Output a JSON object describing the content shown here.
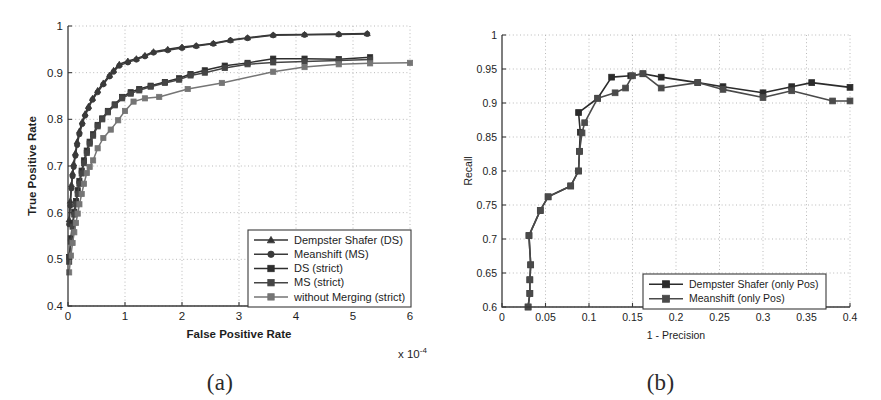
{
  "figure": {
    "background_color": "#ffffff",
    "captions": [
      {
        "key": "a",
        "text": "(a)"
      },
      {
        "key": "b",
        "text": "(b)"
      }
    ]
  },
  "chart_data": [
    {
      "id": "panel-a",
      "type": "line",
      "title": "",
      "xlabel": "False Positive Rate",
      "ylabel": "True Positive Rate",
      "x_exponent_label": "x 10",
      "x_exponent_power": "-4",
      "xlim": [
        0,
        6
      ],
      "ylim": [
        0.4,
        1
      ],
      "xticks": [
        "0",
        "1",
        "2",
        "3",
        "4",
        "5",
        "6"
      ],
      "xtick_values": [
        0,
        1,
        2,
        3,
        4,
        5,
        6
      ],
      "yticks": [
        "0.4",
        "0.5",
        "0.6",
        "0.7",
        "0.8",
        "0.9",
        "1"
      ],
      "ytick_values": [
        0.4,
        0.5,
        0.6,
        0.7,
        0.8,
        0.9,
        1
      ],
      "grid": true,
      "legend_position": "lower right",
      "series": [
        {
          "name": "Dempster Shafer (DS)",
          "marker": "triangle",
          "color": "#333333",
          "points": [
            [
              0.02,
              0.585
            ],
            [
              0.04,
              0.625
            ],
            [
              0.06,
              0.66
            ],
            [
              0.08,
              0.685
            ],
            [
              0.1,
              0.705
            ],
            [
              0.13,
              0.728
            ],
            [
              0.16,
              0.752
            ],
            [
              0.2,
              0.775
            ],
            [
              0.25,
              0.795
            ],
            [
              0.3,
              0.812
            ],
            [
              0.36,
              0.828
            ],
            [
              0.43,
              0.845
            ],
            [
              0.52,
              0.862
            ],
            [
              0.62,
              0.878
            ],
            [
              0.73,
              0.895
            ],
            [
              0.8,
              0.905
            ],
            [
              0.9,
              0.918
            ],
            [
              1.05,
              0.925
            ],
            [
              1.2,
              0.93
            ],
            [
              1.35,
              0.937
            ],
            [
              1.5,
              0.945
            ],
            [
              1.75,
              0.95
            ],
            [
              2.0,
              0.955
            ],
            [
              2.25,
              0.958
            ],
            [
              2.55,
              0.963
            ],
            [
              2.85,
              0.97
            ],
            [
              3.15,
              0.975
            ],
            [
              3.6,
              0.981
            ],
            [
              4.15,
              0.982
            ],
            [
              4.75,
              0.983
            ],
            [
              5.25,
              0.984
            ]
          ]
        },
        {
          "name": "Meanshift (MS)",
          "marker": "circle",
          "color": "#3a3a3a",
          "points": [
            [
              0.02,
              0.575
            ],
            [
              0.04,
              0.615
            ],
            [
              0.06,
              0.652
            ],
            [
              0.08,
              0.678
            ],
            [
              0.1,
              0.698
            ],
            [
              0.13,
              0.722
            ],
            [
              0.16,
              0.745
            ],
            [
              0.2,
              0.768
            ],
            [
              0.25,
              0.79
            ],
            [
              0.3,
              0.808
            ],
            [
              0.36,
              0.824
            ],
            [
              0.43,
              0.842
            ],
            [
              0.52,
              0.858
            ],
            [
              0.62,
              0.875
            ],
            [
              0.73,
              0.892
            ],
            [
              0.8,
              0.902
            ],
            [
              0.9,
              0.915
            ],
            [
              1.05,
              0.922
            ],
            [
              1.2,
              0.928
            ],
            [
              1.35,
              0.935
            ],
            [
              1.5,
              0.943
            ],
            [
              1.75,
              0.948
            ],
            [
              2.0,
              0.953
            ],
            [
              2.25,
              0.957
            ],
            [
              2.55,
              0.962
            ],
            [
              2.85,
              0.969
            ],
            [
              3.15,
              0.974
            ],
            [
              3.6,
              0.98
            ],
            [
              4.15,
              0.981
            ],
            [
              4.75,
              0.982
            ],
            [
              5.25,
              0.983
            ]
          ]
        },
        {
          "name": "DS (strict)",
          "marker": "square",
          "color": "#2e2e2e",
          "points": [
            [
              0.02,
              0.505
            ],
            [
              0.05,
              0.545
            ],
            [
              0.08,
              0.578
            ],
            [
              0.11,
              0.602
            ],
            [
              0.14,
              0.625
            ],
            [
              0.17,
              0.648
            ],
            [
              0.2,
              0.668
            ],
            [
              0.24,
              0.69
            ],
            [
              0.28,
              0.712
            ],
            [
              0.33,
              0.733
            ],
            [
              0.38,
              0.752
            ],
            [
              0.44,
              0.768
            ],
            [
              0.52,
              0.788
            ],
            [
              0.6,
              0.802
            ],
            [
              0.7,
              0.818
            ],
            [
              0.82,
              0.832
            ],
            [
              0.95,
              0.848
            ],
            [
              1.1,
              0.858
            ],
            [
              1.25,
              0.865
            ],
            [
              1.45,
              0.872
            ],
            [
              1.7,
              0.88
            ],
            [
              1.95,
              0.888
            ],
            [
              2.15,
              0.897
            ],
            [
              2.4,
              0.905
            ],
            [
              2.75,
              0.915
            ],
            [
              3.15,
              0.921
            ],
            [
              3.6,
              0.93
            ],
            [
              4.15,
              0.93
            ],
            [
              4.75,
              0.929
            ],
            [
              5.3,
              0.933
            ]
          ]
        },
        {
          "name": "MS (strict)",
          "marker": "square",
          "color": "#454545",
          "points": [
            [
              0.02,
              0.495
            ],
            [
              0.05,
              0.538
            ],
            [
              0.08,
              0.57
            ],
            [
              0.11,
              0.596
            ],
            [
              0.14,
              0.618
            ],
            [
              0.17,
              0.64
            ],
            [
              0.2,
              0.662
            ],
            [
              0.24,
              0.684
            ],
            [
              0.28,
              0.706
            ],
            [
              0.33,
              0.728
            ],
            [
              0.38,
              0.748
            ],
            [
              0.44,
              0.765
            ],
            [
              0.52,
              0.785
            ],
            [
              0.6,
              0.8
            ],
            [
              0.7,
              0.815
            ],
            [
              0.82,
              0.83
            ],
            [
              0.95,
              0.845
            ],
            [
              1.1,
              0.855
            ],
            [
              1.25,
              0.862
            ],
            [
              1.45,
              0.87
            ],
            [
              1.7,
              0.878
            ],
            [
              1.95,
              0.885
            ],
            [
              2.15,
              0.894
            ],
            [
              2.4,
              0.9
            ],
            [
              2.75,
              0.91
            ],
            [
              3.15,
              0.918
            ],
            [
              3.6,
              0.922
            ],
            [
              4.15,
              0.924
            ],
            [
              4.75,
              0.926
            ],
            [
              5.3,
              0.928
            ]
          ]
        },
        {
          "name": "without Merging (strict)",
          "marker": "square",
          "color": "#757575",
          "points": [
            [
              0.02,
              0.472
            ],
            [
              0.05,
              0.508
            ],
            [
              0.08,
              0.535
            ],
            [
              0.11,
              0.558
            ],
            [
              0.14,
              0.578
            ],
            [
              0.17,
              0.598
            ],
            [
              0.2,
              0.618
            ],
            [
              0.24,
              0.64
            ],
            [
              0.28,
              0.662
            ],
            [
              0.33,
              0.685
            ],
            [
              0.38,
              0.698
            ],
            [
              0.44,
              0.712
            ],
            [
              0.52,
              0.738
            ],
            [
              0.62,
              0.76
            ],
            [
              0.75,
              0.778
            ],
            [
              0.88,
              0.798
            ],
            [
              1.0,
              0.818
            ],
            [
              1.15,
              0.838
            ],
            [
              1.35,
              0.845
            ],
            [
              1.6,
              0.848
            ],
            [
              2.1,
              0.865
            ],
            [
              2.7,
              0.878
            ],
            [
              3.6,
              0.902
            ],
            [
              4.15,
              0.912
            ],
            [
              4.75,
              0.918
            ],
            [
              5.3,
              0.92
            ],
            [
              6.0,
              0.921
            ]
          ]
        }
      ]
    },
    {
      "id": "panel-b",
      "type": "line",
      "title": "",
      "xlabel": "1 - Precision",
      "ylabel": "Recall",
      "xlim": [
        0,
        0.4
      ],
      "ylim": [
        0.6,
        1
      ],
      "xticks": [
        "0",
        "0.05",
        "0.1",
        "0.15",
        "0.2",
        "0.25",
        "0.3",
        "0.35",
        "0.4"
      ],
      "xtick_values": [
        0,
        0.05,
        0.1,
        0.15,
        0.2,
        0.25,
        0.3,
        0.35,
        0.4
      ],
      "yticks": [
        "0.6",
        "0.65",
        "0.7",
        "0.75",
        "0.8",
        "0.85",
        "0.9",
        "0.95",
        "1"
      ],
      "ytick_values": [
        0.6,
        0.65,
        0.7,
        0.75,
        0.8,
        0.85,
        0.9,
        0.95,
        1
      ],
      "grid": true,
      "legend_position": "lower right",
      "series": [
        {
          "name": "Dempster Shafer (only Pos)",
          "marker": "square",
          "color": "#2b2b2b",
          "points": [
            [
              0.03,
              0.6
            ],
            [
              0.032,
              0.62
            ],
            [
              0.032,
              0.64
            ],
            [
              0.033,
              0.662
            ],
            [
              0.031,
              0.705
            ],
            [
              0.044,
              0.742
            ],
            [
              0.053,
              0.762
            ],
            [
              0.079,
              0.778
            ],
            [
              0.088,
              0.8
            ],
            [
              0.089,
              0.829
            ],
            [
              0.09,
              0.857
            ],
            [
              0.088,
              0.886
            ],
            [
              0.11,
              0.907
            ],
            [
              0.126,
              0.938
            ],
            [
              0.148,
              0.94
            ],
            [
              0.162,
              0.943
            ],
            [
              0.183,
              0.938
            ],
            [
              0.225,
              0.93
            ],
            [
              0.254,
              0.924
            ],
            [
              0.3,
              0.915
            ],
            [
              0.333,
              0.924
            ],
            [
              0.356,
              0.93
            ],
            [
              0.4,
              0.923
            ]
          ]
        },
        {
          "name": "Meanshift (only Pos)",
          "marker": "square",
          "color": "#4a4a4a",
          "points": [
            [
              0.03,
              0.6
            ],
            [
              0.032,
              0.62
            ],
            [
              0.032,
              0.64
            ],
            [
              0.033,
              0.662
            ],
            [
              0.031,
              0.705
            ],
            [
              0.044,
              0.742
            ],
            [
              0.053,
              0.762
            ],
            [
              0.079,
              0.778
            ],
            [
              0.088,
              0.8
            ],
            [
              0.089,
              0.829
            ],
            [
              0.092,
              0.856
            ],
            [
              0.095,
              0.871
            ],
            [
              0.11,
              0.907
            ],
            [
              0.13,
              0.915
            ],
            [
              0.142,
              0.922
            ],
            [
              0.15,
              0.94
            ],
            [
              0.162,
              0.943
            ],
            [
              0.183,
              0.922
            ],
            [
              0.225,
              0.93
            ],
            [
              0.254,
              0.92
            ],
            [
              0.3,
              0.908
            ],
            [
              0.333,
              0.918
            ],
            [
              0.38,
              0.903
            ],
            [
              0.4,
              0.903
            ]
          ]
        }
      ]
    }
  ]
}
